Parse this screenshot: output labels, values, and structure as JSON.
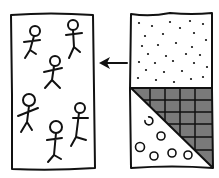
{
  "caption": "",
  "diagram": {
    "left_panel": {
      "label": "group of people",
      "figure_count": 6
    },
    "arrow": {
      "direction": "left"
    },
    "right_panel": {
      "top_region": "dotted pattern",
      "bottom_right_triangle": "gray cross-hatched grid",
      "bottom_left_triangle": "circles",
      "circle_count": 6
    },
    "colors": {
      "ink": "#111111",
      "hatch_fill": "#7a7a7a",
      "background": "#ffffff"
    }
  }
}
